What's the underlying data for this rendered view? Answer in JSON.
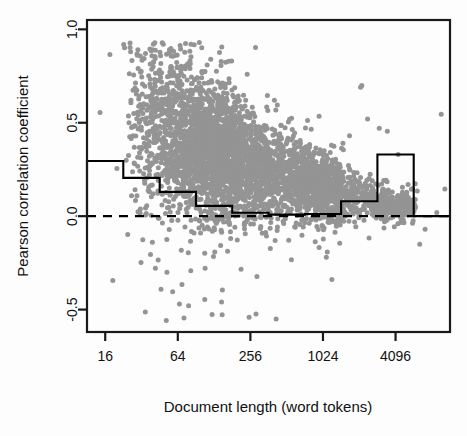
{
  "chart_data": {
    "type": "scatter",
    "title": "",
    "subtitle": "",
    "xlabel": "Document length (word tokens)",
    "ylabel": "Pearson correlation coefficient",
    "x_scale": "log2",
    "xticks": [
      16,
      64,
      256,
      1024,
      4096
    ],
    "xtick_labels": [
      "16",
      "64",
      "256",
      "1024",
      "4096"
    ],
    "yticks": [
      1.0,
      0.5,
      0.0,
      -0.5
    ],
    "ytick_labels": [
      "1.0",
      "0.5",
      "0.0",
      "-0.5"
    ],
    "xlim": [
      11.3,
      11585
    ],
    "ylim": [
      -0.62,
      1.05
    ],
    "grid": false,
    "legend": null,
    "point_color": "#949494",
    "point_size": 5,
    "reference_line": {
      "name": "zero-line",
      "y": 0.0,
      "style": "dashed",
      "color": "#000000"
    },
    "step_overlay": {
      "name": "binned-mean-step",
      "style": "solid",
      "color": "#000000",
      "bin_edges": [
        11.3,
        22.6,
        45.3,
        90.5,
        181,
        362,
        724,
        1448,
        2896,
        5793,
        11585
      ],
      "bin_edge_labels": [
        "16/√2",
        "22.6",
        "45",
        "90",
        "181",
        "362",
        "724",
        "1448",
        "2896",
        "5793",
        "11585"
      ],
      "values": [
        0.295,
        0.205,
        0.13,
        0.055,
        0.018,
        0.008,
        0.012,
        0.08,
        0.33,
        0.0
      ]
    },
    "series": [
      {
        "name": "documents",
        "n_points": 4200,
        "description": "Pearson correlation coefficient per document versus document length in word tokens",
        "color": "#949494",
        "trend": "correlation decreases and variance narrows as document length increases"
      }
    ],
    "annotations": []
  },
  "figure": {
    "background": "#fdfdfd",
    "plot_box_color": "#1a1a1a",
    "plot_box": {
      "left": 87,
      "top": 20,
      "right": 450,
      "bottom": 332
    }
  }
}
